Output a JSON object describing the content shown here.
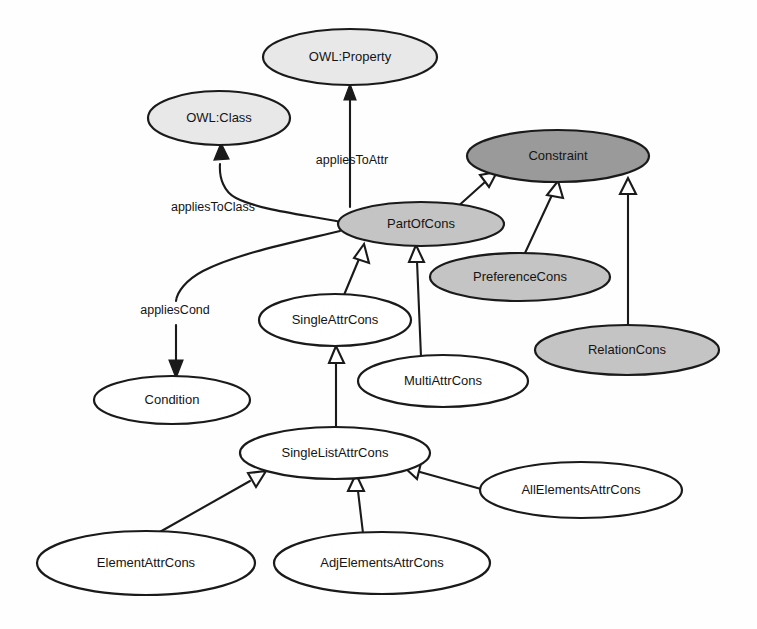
{
  "diagram": {
    "width": 757,
    "height": 629,
    "background": "#fefefe",
    "stroke_color": "#1a1a1a",
    "palette": {
      "light_gray": "#e8e8e8",
      "medium_gray": "#c4c4c4",
      "dark_gray": "#9a9a9a",
      "white": "#ffffff"
    },
    "nodes": [
      {
        "id": "owl-property",
        "label": "OWL:Property",
        "cx": 350,
        "cy": 57,
        "rx": 87,
        "ry": 28,
        "fill": "#e8e8e8",
        "shade": "light-gray"
      },
      {
        "id": "owl-class",
        "label": "OWL:Class",
        "cx": 219,
        "cy": 118,
        "rx": 71,
        "ry": 27,
        "fill": "#e8e8e8",
        "shade": "light-gray"
      },
      {
        "id": "constraint",
        "label": "Constraint",
        "cx": 558,
        "cy": 156,
        "rx": 91,
        "ry": 26,
        "fill": "#9a9a9a",
        "shade": "dark-gray"
      },
      {
        "id": "partofcons",
        "label": "PartOfCons",
        "cx": 421,
        "cy": 224,
        "rx": 83,
        "ry": 22,
        "fill": "#c4c4c4",
        "shade": "medium-gray"
      },
      {
        "id": "preferencecons",
        "label": "PreferenceCons",
        "cx": 520,
        "cy": 277,
        "rx": 90,
        "ry": 24,
        "fill": "#c4c4c4",
        "shade": "medium-gray"
      },
      {
        "id": "relationcons",
        "label": "RelationCons",
        "cx": 627,
        "cy": 350,
        "rx": 92,
        "ry": 25,
        "fill": "#c4c4c4",
        "shade": "medium-gray"
      },
      {
        "id": "singleattrcons",
        "label": "SingleAttrCons",
        "cx": 335,
        "cy": 320,
        "rx": 76,
        "ry": 26,
        "fill": "#ffffff",
        "shade": "white"
      },
      {
        "id": "multiattrcons",
        "label": "MultiAttrCons",
        "cx": 443,
        "cy": 381,
        "rx": 85,
        "ry": 26,
        "fill": "#ffffff",
        "shade": "white"
      },
      {
        "id": "condition",
        "label": "Condition",
        "cx": 172,
        "cy": 400,
        "rx": 78,
        "ry": 24,
        "fill": "#ffffff",
        "shade": "white"
      },
      {
        "id": "singlelistattrcons",
        "label": "SingleListAttrCons",
        "cx": 335,
        "cy": 453,
        "rx": 95,
        "ry": 26,
        "fill": "#ffffff",
        "shade": "white"
      },
      {
        "id": "allelementsattrcons",
        "label": "AllElementsAttrCons",
        "cx": 581,
        "cy": 490,
        "rx": 101,
        "ry": 28,
        "fill": "#ffffff",
        "shade": "white"
      },
      {
        "id": "elementattrcons",
        "label": "ElementAttrCons",
        "cx": 146,
        "cy": 563,
        "rx": 109,
        "ry": 32,
        "fill": "#ffffff",
        "shade": "white"
      },
      {
        "id": "adjelementsattrcons",
        "label": "AdjElementsAttrCons",
        "cx": 382,
        "cy": 563,
        "rx": 108,
        "ry": 31,
        "fill": "#ffffff",
        "shade": "white"
      }
    ],
    "edge_labels": [
      {
        "id": "applies-to-attr",
        "text": "appliesToAttr",
        "x": 352,
        "y": 161
      },
      {
        "id": "applies-to-class",
        "text": "appliesToClass",
        "x": 213,
        "y": 208
      },
      {
        "id": "applies-cond",
        "text": "appliesCond",
        "x": 175,
        "y": 311
      }
    ],
    "edges": [
      {
        "id": "partofcons-to-owlproperty",
        "from": "partofcons",
        "to": "owl-property",
        "label": "appliesToAttr",
        "arrow": "solid",
        "kind": "association"
      },
      {
        "id": "partofcons-to-owlclass",
        "from": "partofcons",
        "to": "owl-class",
        "label": "appliesToClass",
        "arrow": "solid",
        "kind": "association-curved"
      },
      {
        "id": "partofcons-to-condition",
        "from": "partofcons",
        "to": "condition",
        "label": "appliesCond",
        "arrow": "solid",
        "kind": "association-curved"
      },
      {
        "id": "partofcons-to-constraint",
        "from": "partofcons",
        "to": "constraint",
        "label": "",
        "arrow": "hollow",
        "kind": "generalization"
      },
      {
        "id": "preferencecons-to-constraint",
        "from": "preferencecons",
        "to": "constraint",
        "label": "",
        "arrow": "hollow",
        "kind": "generalization"
      },
      {
        "id": "relationcons-to-constraint",
        "from": "relationcons",
        "to": "constraint",
        "label": "",
        "arrow": "hollow",
        "kind": "generalization"
      },
      {
        "id": "singleattrcons-to-partofcons",
        "from": "singleattrcons",
        "to": "partofcons",
        "label": "",
        "arrow": "hollow",
        "kind": "generalization"
      },
      {
        "id": "multiattrcons-to-partofcons",
        "from": "multiattrcons",
        "to": "partofcons",
        "label": "",
        "arrow": "hollow",
        "kind": "generalization"
      },
      {
        "id": "singlelistattrcons-to-singleattrcons",
        "from": "singlelistattrcons",
        "to": "singleattrcons",
        "label": "",
        "arrow": "hollow",
        "kind": "generalization"
      },
      {
        "id": "elementattrcons-to-singlelistattrcons",
        "from": "elementattrcons",
        "to": "singlelistattrcons",
        "label": "",
        "arrow": "hollow",
        "kind": "generalization"
      },
      {
        "id": "adjelementsattrcons-to-singlelistattrcons",
        "from": "adjelementsattrcons",
        "to": "singlelistattrcons",
        "label": "",
        "arrow": "hollow",
        "kind": "generalization"
      },
      {
        "id": "allelementsattrcons-to-singlelistattrcons",
        "from": "allelementsattrcons",
        "to": "singlelistattrcons",
        "label": "",
        "arrow": "hollow",
        "kind": "generalization"
      }
    ]
  }
}
